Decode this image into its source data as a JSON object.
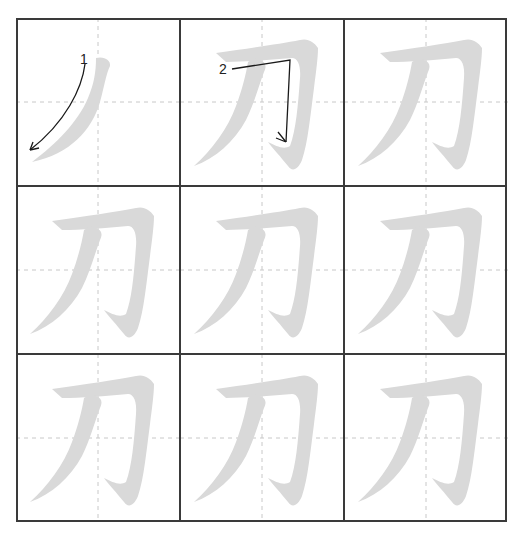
{
  "worksheet": {
    "character": "刀",
    "rows": 3,
    "cols": 3,
    "colors": {
      "grid_line": "#3a3a3a",
      "guide_line": "#c8c8c8",
      "glyph_fill": "#d9d9d9",
      "arrow": "#1a1a1a"
    },
    "cells": [
      {
        "index": 1,
        "type": "stroke-order",
        "strokes_shown": 1,
        "annotation": "1"
      },
      {
        "index": 2,
        "type": "stroke-order",
        "strokes_shown": 2,
        "annotation": "2"
      },
      {
        "index": 3,
        "type": "trace"
      },
      {
        "index": 4,
        "type": "trace"
      },
      {
        "index": 5,
        "type": "trace"
      },
      {
        "index": 6,
        "type": "trace"
      },
      {
        "index": 7,
        "type": "trace"
      },
      {
        "index": 8,
        "type": "trace"
      },
      {
        "index": 9,
        "type": "trace"
      }
    ]
  }
}
